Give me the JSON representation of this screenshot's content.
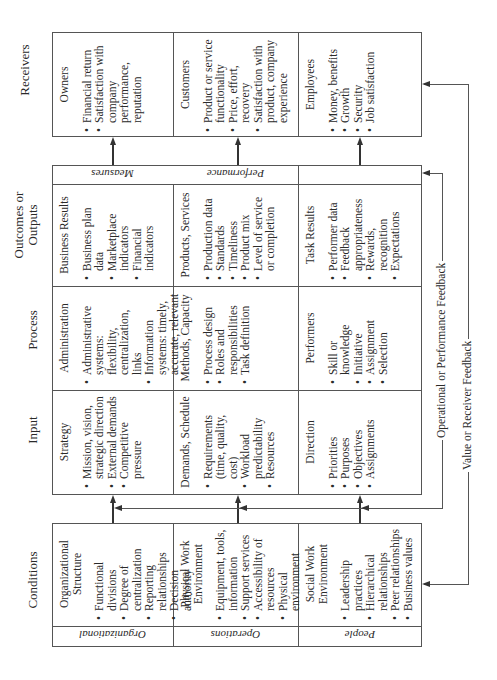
{
  "columns": {
    "receivers": "Receivers",
    "outcomes": "Outcomes or Outputs",
    "process": "Process",
    "input": "Input",
    "conditions": "Conditions"
  },
  "receivers": [
    {
      "title": "Owners",
      "items": [
        "Financial return",
        "Satisfaction with company performance, reputation"
      ]
    },
    {
      "title": "Customers",
      "items": [
        "Product or service functionality",
        "Price, effort, recovery",
        "Satisfaction with product, company experience"
      ]
    },
    {
      "title": "Employees",
      "items": [
        "Money, benefits",
        "Growth",
        "Security",
        "Job satisfaction"
      ]
    }
  ],
  "measures_strip": {
    "left": "Measures",
    "middle": "Performance"
  },
  "outcomes": [
    {
      "title": "Business Results",
      "items": [
        "Business plan data",
        "Marketplace indicators",
        "Financial indicators"
      ]
    },
    {
      "title": "Products, Services",
      "items": [
        "Production data",
        "Standards",
        "Timeliness",
        "Product mix",
        "Level of service or completion"
      ]
    },
    {
      "title": "Task Results",
      "items": [
        "Performer data",
        "Feedback appropriateness",
        "Rewards, recognition",
        "Expectations"
      ]
    }
  ],
  "process": [
    {
      "title": "Administration",
      "items": [
        "Administrative systems: flexibility, centralization, links",
        "Information systems: timely, accurate, relevant"
      ]
    },
    {
      "title": "Methods, Capacity",
      "items": [
        "Process design",
        "Roles and responsibilities",
        "Task definition"
      ]
    },
    {
      "title": "Performers",
      "items": [
        "Skill or knowledge",
        "Initiative",
        "Assignment",
        "Selection"
      ]
    }
  ],
  "input": [
    {
      "title": "Strategy",
      "items": [
        "Mission, vision, strategic direction",
        "External demands",
        "Competitive pressure"
      ]
    },
    {
      "title": "Demands, Schedule",
      "items": [
        "Requirements (time, quality, cost)",
        "Workload predictability",
        "Resources"
      ]
    },
    {
      "title": "Direction",
      "items": [
        "Priorities",
        "Purposes",
        "Objectives",
        "Assignments"
      ]
    }
  ],
  "conditions": [
    {
      "title": "Organizational Structure",
      "items": [
        "Functional divisions",
        "Degree of centralization",
        "Reporting relationships",
        "Decision authority"
      ],
      "label": "Organizational"
    },
    {
      "title": "Physical Work Environment",
      "items": [
        "Equipment, tools, information",
        "Support services",
        "Accessibility of resources",
        "Physical environment"
      ],
      "label": "Operations"
    },
    {
      "title": "Social Work Environment",
      "items": [
        "Leadership practices",
        "Hierarchical relationships",
        "Peer relationships",
        "Business values"
      ],
      "label": "People"
    }
  ],
  "feedback": {
    "operational": "Operational or Performance Feedback",
    "value": "Value or Receiver Feedback"
  },
  "colors": {
    "line": "#555555",
    "text": "#2a2a2a",
    "background": "#ffffff"
  }
}
